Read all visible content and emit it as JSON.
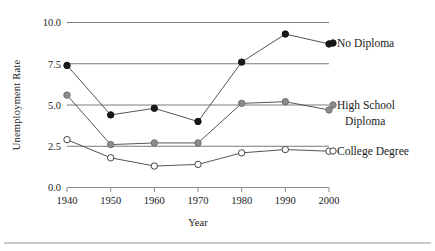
{
  "chart_data": {
    "type": "line",
    "title": "",
    "xlabel": "Year",
    "ylabel": "Unemployment Rate",
    "categories": [
      1940,
      1950,
      1960,
      1970,
      1980,
      1990,
      2000
    ],
    "x_tick_labels": [
      "1940",
      "1950",
      "1960",
      "1970",
      "1980",
      "1990",
      "2000"
    ],
    "y_tick_labels": [
      "0.0",
      "2.5",
      "5.0",
      "7.5",
      "10.0"
    ],
    "y_ticks": [
      0.0,
      2.5,
      5.0,
      7.5,
      10.0
    ],
    "ylim": [
      0.0,
      10.0
    ],
    "xlim": [
      1940,
      2000
    ],
    "grid": "horizontal",
    "legend_position": "right-inline",
    "series": [
      {
        "name": "No Diploma",
        "marker": "filled-circle",
        "color": "#1a1a1a",
        "values": [
          7.4,
          4.4,
          4.8,
          4.0,
          7.6,
          9.3,
          8.7
        ]
      },
      {
        "name": "High School Diploma",
        "marker": "gray-circle",
        "color": "#8c8c8c",
        "values": [
          5.6,
          2.6,
          2.7,
          2.7,
          5.1,
          5.2,
          4.7
        ]
      },
      {
        "name": "College Degree",
        "marker": "open-circle",
        "color": "#ffffff",
        "values": [
          2.9,
          1.8,
          1.3,
          1.4,
          2.1,
          2.3,
          2.2
        ]
      }
    ]
  },
  "legend": {
    "items": [
      {
        "label_line1": "No Diploma",
        "label_line2": ""
      },
      {
        "label_line1": "High School",
        "label_line2": "Diploma"
      },
      {
        "label_line1": "College Degree",
        "label_line2": ""
      }
    ]
  },
  "colors": {
    "no_diploma": "#1a1a1a",
    "high_school": "#8c8c8c",
    "college": "#ffffff",
    "gridline": "#7a7a7a",
    "axis": "#8a8a8a",
    "series_line": "#555555",
    "text": "#1a1a1a"
  }
}
